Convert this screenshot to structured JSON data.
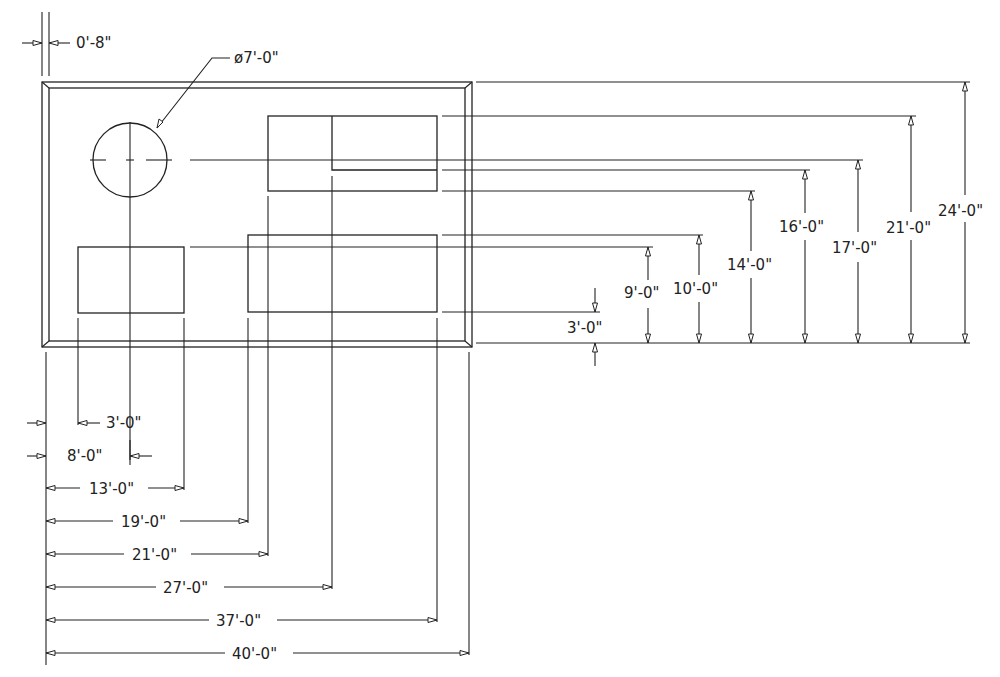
{
  "drawing": {
    "plate_thickness_label": "0'-8\"",
    "hole_diameter_label": "ø7'-0\"",
    "vertical_dims": [
      {
        "label": "3'-0\""
      },
      {
        "label": "9'-0\""
      },
      {
        "label": "10'-0\""
      },
      {
        "label": "14'-0\""
      },
      {
        "label": "16'-0\""
      },
      {
        "label": "17'-0\""
      },
      {
        "label": "21'-0\""
      },
      {
        "label": "24'-0\""
      }
    ],
    "horizontal_dims": [
      {
        "label": "3'-0\""
      },
      {
        "label": "8'-0\""
      },
      {
        "label": "13'-0\""
      },
      {
        "label": "19'-0\""
      },
      {
        "label": "21'-0\""
      },
      {
        "label": "27'-0\""
      },
      {
        "label": "37'-0\""
      },
      {
        "label": "40'-0\""
      }
    ],
    "colors": {
      "line": "#222222",
      "background": "#ffffff"
    }
  }
}
